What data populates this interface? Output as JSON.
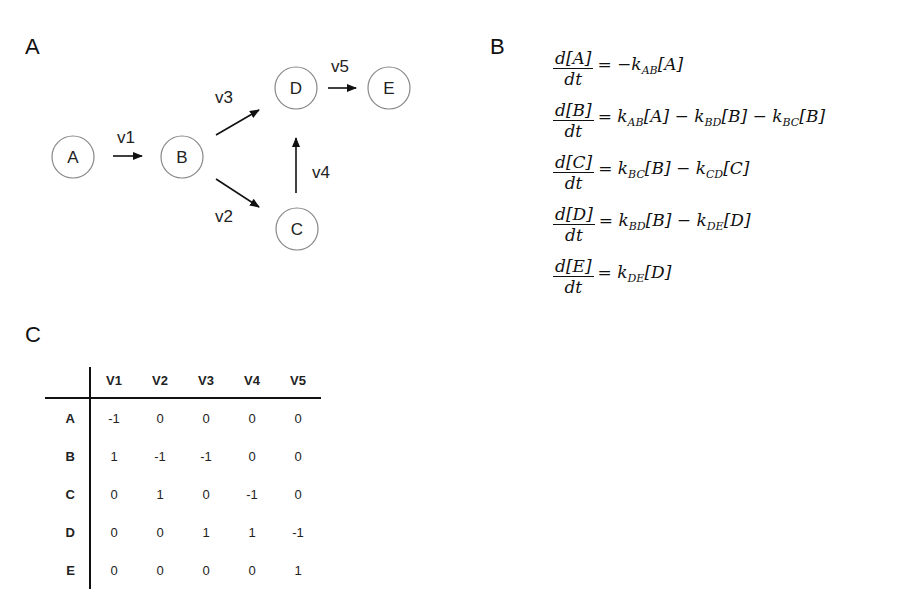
{
  "panels": {
    "a": {
      "label": "A",
      "nodes": [
        {
          "id": "A",
          "label": "A",
          "cx": 73,
          "cy": 157
        },
        {
          "id": "B",
          "label": "B",
          "cx": 182,
          "cy": 157
        },
        {
          "id": "C",
          "label": "C",
          "cx": 297,
          "cy": 229
        },
        {
          "id": "D",
          "label": "D",
          "cx": 296,
          "cy": 88
        },
        {
          "id": "E",
          "label": "E",
          "cx": 389,
          "cy": 88
        }
      ],
      "edges": [
        {
          "id": "v1",
          "label": "v1",
          "from": "A",
          "to": "B"
        },
        {
          "id": "v2",
          "label": "v2",
          "from": "B",
          "to": "C"
        },
        {
          "id": "v3",
          "label": "v3",
          "from": "B",
          "to": "D"
        },
        {
          "id": "v4",
          "label": "v4",
          "from": "C",
          "to": "D"
        },
        {
          "id": "v5",
          "label": "v5",
          "from": "D",
          "to": "E"
        }
      ]
    },
    "b": {
      "label": "B",
      "equations": [
        {
          "num": "d[A]",
          "den": "dt",
          "rhs": [
            {
              "t": "= −k"
            },
            {
              "sub": "AB"
            },
            {
              "t": "[A]"
            }
          ]
        },
        {
          "num": "d[B]",
          "den": "dt",
          "rhs": [
            {
              "t": "= k"
            },
            {
              "sub": "AB"
            },
            {
              "t": "[A] − k"
            },
            {
              "sub": "BD"
            },
            {
              "t": "[B] − k"
            },
            {
              "sub": "BC"
            },
            {
              "t": "[B]"
            }
          ]
        },
        {
          "num": "d[C]",
          "den": "dt",
          "rhs": [
            {
              "t": "= k"
            },
            {
              "sub": "BC"
            },
            {
              "t": "[B] − k"
            },
            {
              "sub": "CD"
            },
            {
              "t": "[C]"
            }
          ]
        },
        {
          "num": "d[D]",
          "den": "dt",
          "rhs": [
            {
              "t": "= k"
            },
            {
              "sub": "BD"
            },
            {
              "t": "[B] − k"
            },
            {
              "sub": "DE"
            },
            {
              "t": "[D]"
            }
          ]
        },
        {
          "num": "d[E]",
          "den": "dt",
          "rhs": [
            {
              "t": "= k"
            },
            {
              "sub": "DE"
            },
            {
              "t": "[D]"
            }
          ]
        }
      ]
    },
    "c": {
      "label": "C",
      "table": {
        "columns": [
          "V1",
          "V2",
          "V3",
          "V4",
          "V5"
        ],
        "rows": [
          {
            "label": "A",
            "values": [
              "-1",
              "0",
              "0",
              "0",
              "0"
            ]
          },
          {
            "label": "B",
            "values": [
              "1",
              "-1",
              "-1",
              "0",
              "0"
            ]
          },
          {
            "label": "C",
            "values": [
              "0",
              "1",
              "0",
              "-1",
              "0"
            ]
          },
          {
            "label": "D",
            "values": [
              "0",
              "0",
              "1",
              "1",
              "-1"
            ]
          },
          {
            "label": "E",
            "values": [
              "0",
              "0",
              "0",
              "0",
              "1"
            ]
          }
        ]
      }
    }
  }
}
